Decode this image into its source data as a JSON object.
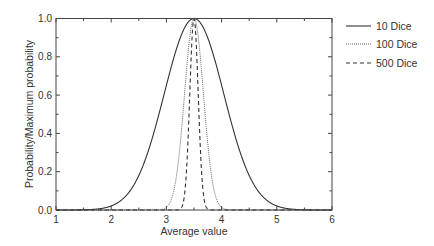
{
  "chart_data": {
    "type": "line",
    "title": "",
    "xlabel": "Average value",
    "ylabel": "Probability/Maximum probability",
    "xlim": [
      1,
      6
    ],
    "ylim": [
      0.0,
      1.0
    ],
    "xticks": [
      "1",
      "2",
      "3",
      "4",
      "5",
      "6"
    ],
    "yticks": [
      "0.0",
      "0.2",
      "0.4",
      "0.6",
      "0.8",
      "1.0"
    ],
    "grid": false,
    "legend_position": "outside-right-top",
    "series": [
      {
        "name": "10 Dice",
        "style": "solid",
        "mean": 3.5,
        "sigma": 0.54,
        "x": [
          1.5,
          2.0,
          2.5,
          3.0,
          3.5,
          4.0,
          4.5,
          5.0,
          5.5
        ],
        "y": [
          0.001,
          0.021,
          0.18,
          0.65,
          1.0,
          0.65,
          0.18,
          0.021,
          0.001
        ]
      },
      {
        "name": "100 Dice",
        "style": "dotted",
        "mean": 3.5,
        "sigma": 0.171,
        "x": [
          3.0,
          3.2,
          3.3,
          3.4,
          3.5,
          3.6,
          3.7,
          3.8,
          4.0
        ],
        "y": [
          0.014,
          0.21,
          0.5,
          0.84,
          1.0,
          0.84,
          0.5,
          0.21,
          0.014
        ]
      },
      {
        "name": "500 Dice",
        "style": "dashed",
        "mean": 3.5,
        "sigma": 0.0764,
        "x": [
          3.25,
          3.35,
          3.4,
          3.45,
          3.5,
          3.55,
          3.6,
          3.65,
          3.75
        ],
        "y": [
          0.005,
          0.15,
          0.42,
          0.81,
          1.0,
          0.81,
          0.42,
          0.15,
          0.005
        ]
      }
    ]
  },
  "legend": {
    "items": [
      "10 Dice",
      "100 Dice",
      "500 Dice"
    ]
  }
}
